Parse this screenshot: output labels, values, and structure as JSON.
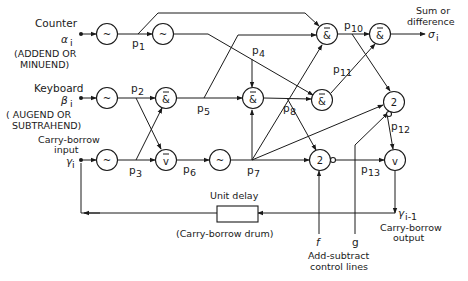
{
  "diagram": {
    "type": "logic-circuit",
    "inputs": {
      "counter": {
        "label": "Counter",
        "symbol": "α",
        "subscript": "i",
        "note1": "(ADDEND OR",
        "note2": "MINUEND)"
      },
      "keyboard": {
        "label": "Keyboard",
        "symbol": "β",
        "subscript": "i",
        "note1": "( AUGEND OR",
        "note2": "SUBTRAHEND)"
      },
      "carry_in": {
        "label1": "Carry-borrow",
        "label2": "input",
        "symbol": "γ",
        "subscript": "i"
      }
    },
    "outputs": {
      "sum": {
        "label1": "Sum or",
        "label2": "difference",
        "symbol": "σ",
        "subscript": "i"
      },
      "carry_out": {
        "symbol": "γ",
        "subscript": "i-1",
        "label1": "Carry-borrow",
        "label2": "output"
      }
    },
    "gates": {
      "not": "~",
      "nand": "&",
      "nor": "v",
      "or": "v",
      "threshold": "2"
    },
    "points": {
      "p1": {
        "p": "p",
        "n": "1"
      },
      "p2": {
        "p": "p",
        "n": "2"
      },
      "p3": {
        "p": "p",
        "n": "3"
      },
      "p4": {
        "p": "p",
        "n": "4"
      },
      "p5": {
        "p": "p",
        "n": "5"
      },
      "p6": {
        "p": "p",
        "n": "6"
      },
      "p7": {
        "p": "p",
        "n": "7"
      },
      "p8": {
        "p": "p",
        "n": "8"
      },
      "p10": {
        "p": "p",
        "n": "10"
      },
      "p11": {
        "p": "p",
        "n": "11"
      },
      "p12": {
        "p": "p",
        "n": "12"
      },
      "p13": {
        "p": "p",
        "n": "13"
      }
    },
    "delay": {
      "label": "Unit delay",
      "caption": "(Carry-borrow drum)"
    },
    "control": {
      "f": "f",
      "g": "g",
      "label1": "Add-subtract",
      "label2": "control lines"
    }
  }
}
